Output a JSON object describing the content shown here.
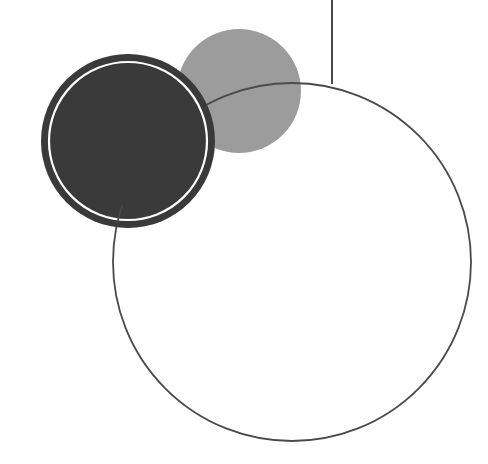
{
  "canvas": {
    "width": 488,
    "height": 464,
    "background": "#ffffff"
  },
  "shapes": {
    "vertical_line": {
      "x": 332,
      "y1": 0,
      "y2": 84,
      "color": "#4a4a4a",
      "width": 2
    },
    "gray_circle": {
      "cx": 239,
      "cy": 91,
      "r": 62,
      "fill": "#9c9c9c"
    },
    "outline_circle": {
      "cx": 292,
      "cy": 262,
      "r": 179,
      "stroke": "#4a4a4a",
      "stroke_width": 1.8
    },
    "dark_circle": {
      "cx": 128,
      "cy": 141,
      "r": 87,
      "fill": "#3a3a3a",
      "ring_color": "#ffffff",
      "ring_r": 79,
      "ring_width": 2.2
    }
  },
  "colors": {
    "dark": "#3a3a3a",
    "gray": "#9c9c9c",
    "line": "#4a4a4a",
    "white": "#ffffff"
  }
}
